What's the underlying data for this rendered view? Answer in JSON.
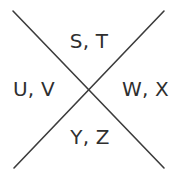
{
  "diagram": {
    "type": "cross-quadrant-label-diagram",
    "background_color": "#ffffff",
    "line_color": "#3c3c3c",
    "text_color": "#2f2f2f",
    "lines": [
      {
        "name": "diagonal-top-left-to-bottom-right",
        "x1": 13,
        "y1": 11,
        "x2": 164,
        "y2": 168
      },
      {
        "name": "diagonal-top-right-to-bottom-left",
        "x1": 164,
        "y1": 11,
        "x2": 14,
        "y2": 168
      }
    ],
    "intersection": {
      "x": 89,
      "y": 90
    },
    "labels": {
      "top": "S, T",
      "left": "U, V",
      "right": "W, X",
      "bottom": "Y, Z"
    }
  }
}
